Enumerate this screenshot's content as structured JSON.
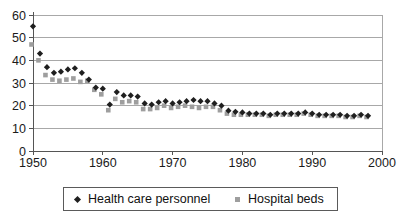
{
  "chart_data": {
    "type": "scatter",
    "title": "",
    "xlabel": "",
    "ylabel": "",
    "xlim": [
      1950,
      2000
    ],
    "ylim": [
      0,
      60
    ],
    "x_ticks": [
      1950,
      1960,
      1970,
      1980,
      1990,
      2000
    ],
    "y_ticks": [
      0,
      10,
      20,
      30,
      40,
      50,
      60
    ],
    "grid": "horizontal",
    "legend_position": "bottom-center",
    "background": "#ffffff",
    "grid_color": "#a8a8a8",
    "axis_color": "#555555",
    "text_color": "#1a1a1a",
    "x": [
      1950,
      1951,
      1952,
      1953,
      1954,
      1955,
      1956,
      1957,
      1958,
      1959,
      1960,
      1961,
      1962,
      1963,
      1964,
      1965,
      1966,
      1967,
      1968,
      1969,
      1970,
      1971,
      1972,
      1973,
      1974,
      1975,
      1976,
      1977,
      1978,
      1979,
      1980,
      1981,
      1982,
      1983,
      1984,
      1985,
      1986,
      1987,
      1988,
      1989,
      1990,
      1991,
      1992,
      1993,
      1994,
      1995,
      1996,
      1997,
      1998
    ],
    "series": [
      {
        "name": "Health care personnel",
        "marker": "diamond",
        "color": "#1f1f1f",
        "values": [
          55,
          43,
          37,
          34.5,
          35,
          36,
          36.5,
          34.5,
          31.5,
          28,
          27.5,
          20.5,
          26,
          24.5,
          24.5,
          24,
          21,
          20.5,
          21.5,
          22,
          21,
          21.5,
          22,
          22.5,
          22,
          22,
          21,
          20,
          17.8,
          17.3,
          17,
          16.5,
          16.5,
          16.5,
          16,
          16.5,
          16.5,
          16.5,
          16.5,
          17,
          16.5,
          16,
          16,
          16,
          16,
          15.5,
          15.5,
          16,
          15.5
        ]
      },
      {
        "name": "Hospital beds",
        "marker": "square",
        "color": "#9e9e9e",
        "values": [
          47,
          40,
          33.5,
          31.5,
          31,
          31.5,
          32,
          30.5,
          31,
          27,
          25,
          18,
          23,
          21.5,
          22,
          21.5,
          18.5,
          18.5,
          19,
          20,
          19,
          19.5,
          20,
          19.5,
          19,
          19.5,
          19.5,
          18,
          16.5,
          16,
          16,
          16,
          16,
          16,
          15.5,
          16,
          16,
          16,
          16,
          16.5,
          16,
          15.5,
          15.5,
          15.5,
          15.5,
          15,
          15,
          15.5,
          15
        ]
      }
    ]
  },
  "legend": {
    "items": [
      {
        "label": "Health care personnel"
      },
      {
        "label": "Hospital beds"
      }
    ]
  }
}
